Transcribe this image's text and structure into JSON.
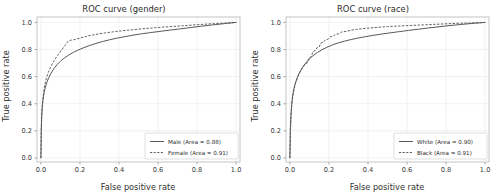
{
  "figure": {
    "background": "#ffffff",
    "grid_color": "#ededed",
    "axis_color": "#b6b6b6",
    "text_color": "#2b2b2b"
  },
  "chart_data": [
    {
      "type": "line",
      "title": "ROC curve (gender)",
      "xlabel": "False positive rate",
      "ylabel": "True positive rate",
      "xlim": [
        -0.02,
        1.02
      ],
      "ylim": [
        -0.03,
        1.04
      ],
      "xticks": [
        "0.0",
        "0.2",
        "0.4",
        "0.6",
        "0.8",
        "1.0"
      ],
      "xtick_values": [
        0.0,
        0.2,
        0.4,
        0.6,
        0.8,
        1.0
      ],
      "yticks": [
        "0.0",
        "0.2",
        "0.4",
        "0.6",
        "0.8",
        "1.0"
      ],
      "ytick_values": [
        0.0,
        0.2,
        0.4,
        0.6,
        0.8,
        1.0
      ],
      "grid": true,
      "legend_position": "lower right",
      "series": [
        {
          "name": "Male (Area = 0.88)",
          "label": "Male",
          "area": 0.88,
          "style": "solid",
          "color": "#4f4f4f",
          "x": [
            0.0,
            0.002,
            0.004,
            0.007,
            0.011,
            0.016,
            0.022,
            0.03,
            0.04,
            0.052,
            0.066,
            0.082,
            0.1,
            0.12,
            0.142,
            0.166,
            0.192,
            0.22,
            0.25,
            0.282,
            0.316,
            0.352,
            0.39,
            0.43,
            0.472,
            0.516,
            0.562,
            0.61,
            0.66,
            0.712,
            0.766,
            0.822,
            0.88,
            0.94,
            1.0
          ],
          "y": [
            0.0,
            0.2,
            0.3,
            0.375,
            0.432,
            0.478,
            0.518,
            0.556,
            0.592,
            0.626,
            0.658,
            0.687,
            0.713,
            0.737,
            0.759,
            0.779,
            0.797,
            0.814,
            0.83,
            0.845,
            0.859,
            0.872,
            0.884,
            0.895,
            0.906,
            0.916,
            0.925,
            0.934,
            0.943,
            0.952,
            0.962,
            0.972,
            0.982,
            0.991,
            1.0
          ]
        },
        {
          "name": "Female (Area = 0.91)",
          "label": "Female",
          "area": 0.91,
          "style": "dashed",
          "color": "#5a5a5a",
          "x": [
            0.0,
            0.002,
            0.005,
            0.009,
            0.014,
            0.02,
            0.028,
            0.038,
            0.05,
            0.064,
            0.08,
            0.098,
            0.118,
            0.14,
            0.152,
            0.168,
            0.2,
            0.24,
            0.282,
            0.326,
            0.372,
            0.42,
            0.47,
            0.52,
            0.57,
            0.62,
            0.672,
            0.724,
            0.778,
            0.832,
            0.886,
            0.94,
            1.0
          ],
          "y": [
            0.0,
            0.22,
            0.335,
            0.42,
            0.486,
            0.54,
            0.588,
            0.632,
            0.672,
            0.71,
            0.745,
            0.78,
            0.82,
            0.862,
            0.868,
            0.872,
            0.884,
            0.9,
            0.912,
            0.922,
            0.931,
            0.939,
            0.946,
            0.953,
            0.959,
            0.965,
            0.97,
            0.975,
            0.981,
            0.986,
            0.991,
            0.995,
            1.0
          ]
        }
      ]
    },
    {
      "type": "line",
      "title": "ROC curve (race)",
      "xlabel": "False positive rate",
      "ylabel": "True positive rate",
      "xlim": [
        -0.02,
        1.02
      ],
      "ylim": [
        -0.03,
        1.04
      ],
      "xticks": [
        "0.0",
        "0.2",
        "0.4",
        "0.6",
        "0.8",
        "1.0"
      ],
      "xtick_values": [
        0.0,
        0.2,
        0.4,
        0.6,
        0.8,
        1.0
      ],
      "yticks": [
        "0.0",
        "0.2",
        "0.4",
        "0.6",
        "0.8",
        "1.0"
      ],
      "ytick_values": [
        0.0,
        0.2,
        0.4,
        0.6,
        0.8,
        1.0
      ],
      "grid": true,
      "legend_position": "lower right",
      "series": [
        {
          "name": "White (Area = 0.90)",
          "label": "White",
          "area": 0.9,
          "style": "solid",
          "color": "#4f4f4f",
          "x": [
            0.0,
            0.002,
            0.005,
            0.009,
            0.014,
            0.02,
            0.028,
            0.038,
            0.05,
            0.064,
            0.08,
            0.098,
            0.118,
            0.14,
            0.164,
            0.19,
            0.218,
            0.248,
            0.28,
            0.314,
            0.35,
            0.388,
            0.428,
            0.47,
            0.514,
            0.56,
            0.608,
            0.658,
            0.71,
            0.764,
            0.82,
            0.878,
            0.938,
            1.0
          ],
          "y": [
            0.0,
            0.2,
            0.31,
            0.395,
            0.458,
            0.508,
            0.552,
            0.594,
            0.632,
            0.667,
            0.699,
            0.728,
            0.754,
            0.777,
            0.798,
            0.817,
            0.834,
            0.849,
            0.862,
            0.874,
            0.885,
            0.895,
            0.905,
            0.914,
            0.923,
            0.932,
            0.941,
            0.95,
            0.959,
            0.968,
            0.977,
            0.985,
            0.993,
            1.0
          ]
        },
        {
          "name": "Black (Area = 0.91)",
          "label": "Black",
          "area": 0.91,
          "style": "dashed",
          "color": "#5a5a5a",
          "x": [
            0.0,
            0.003,
            0.006,
            0.01,
            0.016,
            0.022,
            0.03,
            0.04,
            0.052,
            0.066,
            0.082,
            0.09,
            0.098,
            0.11,
            0.118,
            0.13,
            0.138,
            0.15,
            0.158,
            0.172,
            0.182,
            0.196,
            0.206,
            0.222,
            0.234,
            0.252,
            0.266,
            0.29,
            0.31,
            0.34,
            0.372,
            0.41,
            0.45,
            0.5,
            0.55,
            0.61,
            0.67,
            0.73,
            0.79,
            0.85,
            0.92,
            1.0
          ],
          "y": [
            0.0,
            0.2,
            0.312,
            0.398,
            0.462,
            0.512,
            0.556,
            0.598,
            0.636,
            0.668,
            0.698,
            0.702,
            0.74,
            0.748,
            0.786,
            0.792,
            0.812,
            0.818,
            0.848,
            0.854,
            0.872,
            0.876,
            0.894,
            0.898,
            0.912,
            0.916,
            0.93,
            0.934,
            0.942,
            0.948,
            0.954,
            0.959,
            0.964,
            0.969,
            0.973,
            0.977,
            0.981,
            0.985,
            0.989,
            0.993,
            0.996,
            1.0
          ]
        }
      ]
    }
  ]
}
